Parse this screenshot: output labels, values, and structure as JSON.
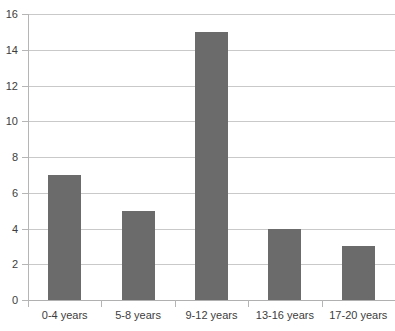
{
  "chart_data": {
    "type": "bar",
    "title": "",
    "subtitle": "",
    "xlabel": "",
    "ylabel": "",
    "categories": [
      "0-4 years",
      "5-8 years",
      "9-12 years",
      "13-16 years",
      "17-20 years"
    ],
    "values": [
      7,
      5,
      15,
      4,
      3
    ],
    "ylim": [
      0,
      16
    ],
    "ytick_step": 2,
    "yticks": [
      "0",
      "2",
      "4",
      "6",
      "8",
      "10",
      "12",
      "14",
      "16"
    ],
    "ytick_values": [
      0,
      2,
      4,
      6,
      8,
      10,
      12,
      14,
      16
    ],
    "grid": "horizontal",
    "legend": "none",
    "annotations": [],
    "colors": {
      "bar": "#6b6b6b",
      "gridline": "#c9c9c9",
      "axis": "#b5b5b5",
      "background": "#ffffff",
      "text": "#3d3d3d"
    }
  }
}
